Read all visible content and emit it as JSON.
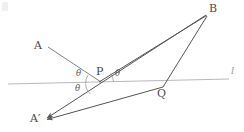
{
  "figure": {
    "type": "geometry-diagram",
    "background_color": "#ffffff",
    "stroke_color": "#555555",
    "line_l_color": "#a8a8a8",
    "label_color": "#4a4a4a",
    "points": {
      "A": {
        "label": "A",
        "x": 37,
        "y": 45
      },
      "B": {
        "label": "B",
        "x": 211,
        "y": 9
      },
      "P": {
        "label": "P",
        "x": 100,
        "y": 73
      },
      "Q": {
        "label": "Q",
        "x": 160,
        "y": 95
      },
      "A_prime": {
        "label": "A′",
        "x": 33,
        "y": 120
      },
      "l": {
        "label": "l",
        "x": 232,
        "y": 71
      }
    },
    "angles": [
      {
        "label": "θ",
        "name": "theta-incident",
        "x": 79,
        "y": 73
      },
      {
        "label": "θ",
        "name": "theta-reflected",
        "x": 113,
        "y": 73
      },
      {
        "label": "θ",
        "name": "theta-vertical",
        "x": 77,
        "y": 86
      }
    ],
    "geometry": {
      "line_l": {
        "x1": 8,
        "y1": 84,
        "x2": 229,
        "y2": 79
      },
      "segment_A_to_P": {
        "x1": 48,
        "y1": 47,
        "x2": 101,
        "y2": 82
      },
      "segment_P_to_B": {
        "x1": 99,
        "y1": 82,
        "x2": 206,
        "y2": 15
      },
      "segment_Aprime_to_B": {
        "x1": 46,
        "y1": 118,
        "x2": 206,
        "y2": 15
      },
      "segment_Aprime_to_Q": {
        "x1": 46,
        "y1": 119,
        "x2": 163,
        "y2": 87
      },
      "segment_Q_to_B": {
        "x1": 163,
        "y1": 87,
        "x2": 207,
        "y2": 16
      },
      "intersection_P": {
        "x": 99.5,
        "y": 82
      },
      "intersection_Q": {
        "x": 163,
        "y": 87
      }
    }
  }
}
